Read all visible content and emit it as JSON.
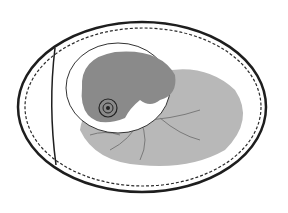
{
  "image": {
    "subject": "egg-with-embryo-illustration",
    "colors": {
      "background": "#ffffff",
      "ink": "#1e1e1e",
      "yolk_gray": "#b8b8b8",
      "embryo_gray": "#8a8a8a",
      "vessel": "#7a7a7a"
    }
  }
}
